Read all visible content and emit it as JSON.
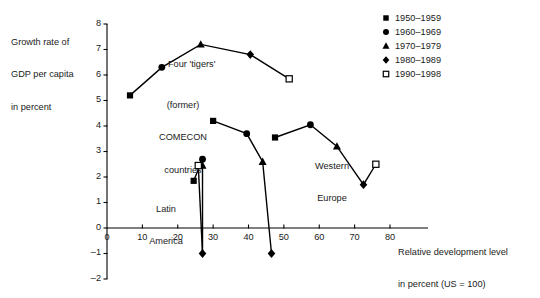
{
  "chart_data": {
    "type": "scatter",
    "title": "",
    "xlabel": "Relative development level in percent (US = 100)",
    "ylabel": "Growth rate of GDP per capita in percent",
    "xlim": [
      0,
      80
    ],
    "ylim": [
      -2,
      8
    ],
    "xticks": [
      0,
      10,
      20,
      30,
      40,
      50,
      60,
      70,
      80
    ],
    "yticks": [
      -2,
      -1,
      0,
      1,
      2,
      3,
      4,
      5,
      6,
      7,
      8
    ],
    "grid": false,
    "legend_position": "top-right",
    "legend": [
      {
        "label": "1950–1959",
        "marker": "square"
      },
      {
        "label": "1960–1969",
        "marker": "circle"
      },
      {
        "label": "1970–1979",
        "marker": "triangle"
      },
      {
        "label": "1980–1989",
        "marker": "diamond"
      },
      {
        "label": "1990–1998",
        "marker": "open-square"
      }
    ],
    "series": [
      {
        "name": "Four 'tigers'",
        "points": [
          {
            "x": 6.5,
            "y": 5.2,
            "marker": "square",
            "period": "1950–1959"
          },
          {
            "x": 15.5,
            "y": 6.3,
            "marker": "circle",
            "period": "1960–1969"
          },
          {
            "x": 26.5,
            "y": 7.2,
            "marker": "triangle",
            "period": "1970–1979"
          },
          {
            "x": 40.5,
            "y": 6.8,
            "marker": "diamond",
            "period": "1980–1989"
          },
          {
            "x": 51.5,
            "y": 5.85,
            "marker": "open-square",
            "period": "1990–1998"
          }
        ]
      },
      {
        "name": "(former) COMECON countries",
        "points": [
          {
            "x": 30.0,
            "y": 4.2,
            "marker": "square",
            "period": "1950–1959"
          },
          {
            "x": 39.5,
            "y": 3.7,
            "marker": "circle",
            "period": "1960–1969"
          },
          {
            "x": 44.0,
            "y": 2.6,
            "marker": "triangle",
            "period": "1970–1979"
          },
          {
            "x": 46.5,
            "y": -1.0,
            "marker": "diamond",
            "period": "1980–1989"
          }
        ]
      },
      {
        "name": "Latin America",
        "points": [
          {
            "x": 24.5,
            "y": 1.85,
            "marker": "square",
            "period": "1950–1959"
          },
          {
            "x": 27.0,
            "y": 2.7,
            "marker": "circle",
            "period": "1960–1969"
          },
          {
            "x": 27.0,
            "y": 2.45,
            "marker": "triangle",
            "period": "1970–1979"
          },
          {
            "x": 27.0,
            "y": -1.0,
            "marker": "diamond",
            "period": "1980–1989"
          },
          {
            "x": 25.8,
            "y": 2.45,
            "marker": "open-square",
            "period": "1990–1998"
          }
        ]
      },
      {
        "name": "Western Europe",
        "points": [
          {
            "x": 47.5,
            "y": 3.55,
            "marker": "square",
            "period": "1950–1959"
          },
          {
            "x": 57.5,
            "y": 4.05,
            "marker": "circle",
            "period": "1960–1969"
          },
          {
            "x": 65.0,
            "y": 3.2,
            "marker": "triangle",
            "period": "1970–1979"
          },
          {
            "x": 72.5,
            "y": 1.7,
            "marker": "diamond",
            "period": "1980–1989"
          },
          {
            "x": 76.0,
            "y": 2.5,
            "marker": "open-square",
            "period": "1990–1998"
          }
        ]
      }
    ],
    "annotations": [
      {
        "text": "Four 'tigers'",
        "for": "Four 'tigers'"
      },
      {
        "text": "(former)\nCOMECON\ncountries",
        "for": "(former) COMECON countries"
      },
      {
        "text": "Latin\nAmerica",
        "for": "Latin America"
      },
      {
        "text": "Western\nEurope",
        "for": "Western Europe"
      }
    ],
    "colors": {
      "marker": "#000000",
      "line": "#000000",
      "axis": "#000000"
    }
  },
  "axis": {
    "ylabel_lines": [
      "Growth rate of",
      "GDP per capita",
      "in percent"
    ],
    "xlabel_lines": [
      "Relative development level",
      "in percent (US = 100)"
    ],
    "xticks": [
      "0",
      "10",
      "20",
      "30",
      "40",
      "50",
      "60",
      "70",
      "80"
    ],
    "yticks": [
      "8",
      "7",
      "6",
      "5",
      "4",
      "3",
      "2",
      "1",
      "0",
      "–1",
      "–2"
    ],
    "origin_label": "0"
  },
  "annotations": {
    "tigers": "Four 'tigers'",
    "comecon_l1": "(former)",
    "comecon_l2": "COMECON",
    "comecon_l3": "countries",
    "latam_l1": "Latin",
    "latam_l2": "America",
    "weurope_l1": "Western",
    "weurope_l2": "Europe"
  },
  "legend": {
    "items": [
      {
        "label": "1950–1959"
      },
      {
        "label": "1960–1969"
      },
      {
        "label": "1970–1979"
      },
      {
        "label": "1980–1989"
      },
      {
        "label": "1990–1998"
      }
    ]
  }
}
